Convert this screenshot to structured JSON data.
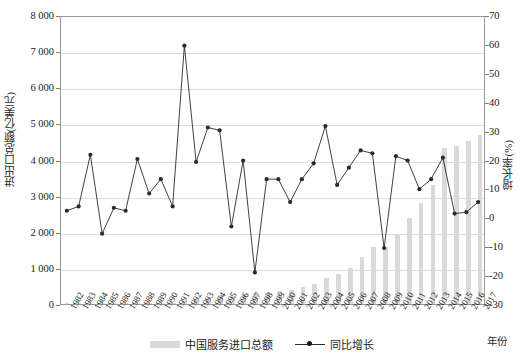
{
  "chart_data": {
    "type": "bar",
    "title": "",
    "xlabel": "年份",
    "ylabel": "进出口总额(亿美元)",
    "y2label": "增长率(%)",
    "ylim": [
      0,
      8000
    ],
    "y2lim": [
      -30,
      70
    ],
    "ytick_labels": [
      "8 000",
      "7 000",
      "6 000",
      "5 000",
      "4 000",
      "3 000",
      "2 000",
      "1 000",
      "0"
    ],
    "ytick_values": [
      8000,
      7000,
      6000,
      5000,
      4000,
      3000,
      2000,
      1000,
      0
    ],
    "y2tick_labels": [
      "70",
      "60",
      "50",
      "40",
      "30",
      "20",
      "10",
      "0",
      "-10",
      "-20",
      "-30"
    ],
    "y2tick_values": [
      70,
      60,
      50,
      40,
      30,
      20,
      10,
      0,
      -10,
      -20,
      -30
    ],
    "grid": true,
    "legend_position": "bottom",
    "categories": [
      "1982",
      "1983",
      "1984",
      "1985",
      "1986",
      "1987",
      "1988",
      "1989",
      "1990",
      "1991",
      "1992",
      "1993",
      "1994",
      "1995",
      "1996",
      "1997",
      "1998",
      "1999",
      "2000",
      "2001",
      "2002",
      "2003",
      "2004",
      "2005",
      "2006",
      "2007",
      "2008",
      "2009",
      "2010",
      "2011",
      "2012",
      "2013",
      "2014",
      "2015",
      "2016",
      "2017"
    ],
    "series": [
      {
        "name": "中国服务进口总额",
        "type": "bar",
        "axis": "left",
        "color": "#d9d9d9",
        "values": [
          20,
          20,
          24,
          26,
          26,
          30,
          36,
          38,
          41,
          41,
          92,
          110,
          162,
          245,
          223,
          277,
          265,
          312,
          360,
          390,
          461,
          550,
          720,
          832,
          1003,
          1302,
          1580,
          1580,
          1922,
          2370,
          2810,
          3291,
          4309,
          4366,
          4526,
          4676
        ]
      },
      {
        "name": "同比增长",
        "type": "line",
        "axis": "right",
        "color": "#2b2b2b",
        "values": [
          2.5,
          4.0,
          22.0,
          -5.5,
          3.5,
          2.5,
          20.5,
          8.5,
          13.5,
          4.0,
          60.0,
          19.5,
          31.5,
          30.5,
          -3.0,
          20.0,
          -19.0,
          13.5,
          13.5,
          5.5,
          13.5,
          19.0,
          32.0,
          11.5,
          17.5,
          23.5,
          22.5,
          -10.5,
          21.5,
          20.0,
          10.0,
          13.5,
          21.0,
          1.5,
          2.0,
          5.5
        ]
      }
    ]
  },
  "legend": {
    "bar_label": "中国服务进口总额",
    "line_label": "同比增长"
  }
}
